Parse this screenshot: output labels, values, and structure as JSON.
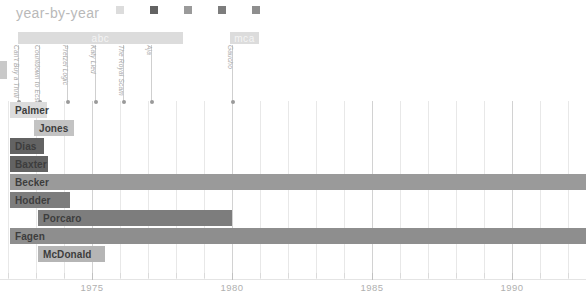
{
  "header": {
    "title": "year-by-year",
    "legend": [
      {
        "label": "Vocals",
        "color": "#dcdcdc",
        "icon": "square-swatch-icon"
      },
      {
        "label": "Guitar",
        "color": "#636363",
        "icon": "square-swatch-icon"
      },
      {
        "label": "Bass",
        "color": "#9a9a9a",
        "icon": "square-swatch-icon"
      },
      {
        "label": "Drums",
        "color": "#7d7d7d",
        "icon": "square-swatch-icon"
      },
      {
        "label": "Keyboards",
        "color": "#8e8e8e",
        "icon": "square-swatch-icon"
      }
    ]
  },
  "chart_data": {
    "type": "bar",
    "title": "year-by-year",
    "xlabel": "",
    "ylabel": "",
    "xlim": [
      1971.2,
      1992.0
    ],
    "grid": true,
    "legend_position": "top",
    "categories": [
      "Palmer",
      "Jones",
      "Dias",
      "Baxter",
      "Becker",
      "Hodder",
      "Porcaro",
      "Fagen",
      "McDonald"
    ],
    "tick_years": [
      1975,
      1980,
      1985,
      1990
    ],
    "tick_labels": [
      "1975",
      "1980",
      "1985",
      "1990"
    ],
    "minor_tick_step": 1,
    "series": [
      {
        "name": "Palmer",
        "role": "Vocals",
        "color": "#dcdcdc",
        "start": 1972.0,
        "end": 1973.4,
        "px_start": 10,
        "px_width": 37
      },
      {
        "name": "Jones",
        "role": "Bass",
        "color": "#c3c3c3",
        "start": 1972.9,
        "end": 1974.6,
        "px_start": 34,
        "px_width": 40
      },
      {
        "name": "Dias",
        "role": "Guitar",
        "color": "#636363",
        "start": 1972.0,
        "end": 1973.6,
        "px_start": 10,
        "px_width": 34
      },
      {
        "name": "Baxter",
        "role": "Guitar",
        "color": "#636363",
        "start": 1972.0,
        "end": 1973.7,
        "px_start": 10,
        "px_width": 38
      },
      {
        "name": "Becker",
        "role": "Guitar",
        "color": "#9a9a9a",
        "start": 1972.0,
        "end": 1992.0,
        "px_start": 10,
        "px_width": 576
      },
      {
        "name": "Hodder",
        "role": "Drums",
        "color": "#7d7d7d",
        "start": 1972.0,
        "end": 1973.8,
        "px_start": 10,
        "px_width": 60
      },
      {
        "name": "Porcaro",
        "role": "Drums",
        "color": "#7d7d7d",
        "start": 1973.0,
        "end": 1980.0,
        "px_start": 38,
        "px_width": 194
      },
      {
        "name": "Fagen",
        "role": "Keyboards",
        "color": "#8e8e8e",
        "start": 1972.0,
        "end": 1992.0,
        "px_start": 10,
        "px_width": 576
      },
      {
        "name": "McDonald",
        "role": "Keyboards",
        "color": "#b5b5b5",
        "start": 1973.0,
        "end": 1975.0,
        "px_start": 38,
        "px_width": 67
      }
    ]
  },
  "label_bars": [
    {
      "name": "abc",
      "px_start": 18,
      "px_width": 165
    },
    {
      "name": "mca",
      "px_start": 230,
      "px_width": 29
    }
  ],
  "albums": [
    {
      "name": "Can't Buy a Thrill",
      "px": 18
    },
    {
      "name": "Countdown to Ecstasy",
      "px": 39
    },
    {
      "name": "Pretzel Logic",
      "px": 67
    },
    {
      "name": "Katy Lied",
      "px": 95
    },
    {
      "name": "The Royal Scam",
      "px": 123
    },
    {
      "name": "Aja",
      "px": 151
    },
    {
      "name": "Gaucho",
      "px": 232
    }
  ]
}
